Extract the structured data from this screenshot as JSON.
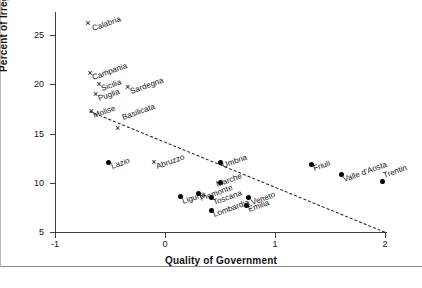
{
  "chart_data": {
    "type": "scatter",
    "title": "",
    "xlabel": "Quality of Government",
    "ylabel": "Percent of Irregular Work",
    "xlim": [
      -1,
      2
    ],
    "ylim": [
      5,
      26.8
    ],
    "xticks": [
      -1,
      0,
      1,
      2
    ],
    "xtick_labels": [
      "-1",
      "0",
      "1",
      "2"
    ],
    "yticks": [
      5,
      10,
      15,
      20,
      25
    ],
    "ytick_labels": [
      "5",
      "10",
      "15",
      "20",
      "25"
    ],
    "grid": false,
    "legend": "none",
    "marker_groups": {
      "cross": "Southern / Island regions marked with x",
      "dot": "Central and Northern regions marked with filled circle"
    },
    "points": [
      {
        "label": "Calabria",
        "x": -0.7,
        "y": 26.2,
        "marker": "cross",
        "label_dx": 6,
        "label_dy": 2
      },
      {
        "label": "Campania",
        "x": -0.68,
        "y": 21.1,
        "marker": "cross",
        "label_dx": 4,
        "label_dy": 1
      },
      {
        "label": "Sicilia",
        "x": -0.6,
        "y": 20.0,
        "marker": "cross",
        "label_dx": 4,
        "label_dy": 1
      },
      {
        "label": "Puglia",
        "x": -0.63,
        "y": 19.0,
        "marker": "cross",
        "label_dx": 4,
        "label_dy": 1
      },
      {
        "label": "Sardegna",
        "x": -0.34,
        "y": 19.7,
        "marker": "cross",
        "label_dx": 4,
        "label_dy": 1
      },
      {
        "label": "Molise",
        "x": -0.67,
        "y": 17.3,
        "marker": "cross",
        "label_dx": 4,
        "label_dy": 1
      },
      {
        "label": "Basilicata",
        "x": -0.43,
        "y": 15.6,
        "marker": "cross",
        "label_dx": 6,
        "label_dy": -14
      },
      {
        "label": "Lazio",
        "x": -0.51,
        "y": 12.1,
        "marker": "dot",
        "label_dx": 4,
        "label_dy": 1
      },
      {
        "label": "Abruzzo",
        "x": -0.1,
        "y": 12.1,
        "marker": "cross",
        "label_dx": 4,
        "label_dy": 1
      },
      {
        "label": "Umbria",
        "x": 0.5,
        "y": 12.1,
        "marker": "dot",
        "label_dx": 4,
        "label_dy": 0
      },
      {
        "label": "Marche",
        "x": 0.5,
        "y": 10.0,
        "marker": "dot",
        "label_dx": -2,
        "label_dy": -2
      },
      {
        "label": "Liguria",
        "x": 0.14,
        "y": 8.6,
        "marker": "dot",
        "label_dx": 4,
        "label_dy": 1
      },
      {
        "label": "Piemonte",
        "x": 0.3,
        "y": 8.9,
        "marker": "dot",
        "label_dx": 4,
        "label_dy": 1
      },
      {
        "label": "Toscana",
        "x": 0.42,
        "y": 8.5,
        "marker": "dot",
        "label_dx": 4,
        "label_dy": 1
      },
      {
        "label": "Lombardia",
        "x": 0.42,
        "y": 7.2,
        "marker": "dot",
        "label_dx": 4,
        "label_dy": 1
      },
      {
        "label": "Veneto",
        "x": 0.76,
        "y": 8.5,
        "marker": "dot",
        "label_dx": 4,
        "label_dy": 1
      },
      {
        "label": "Emilia",
        "x": 0.74,
        "y": 7.7,
        "marker": "dot",
        "label_dx": 4,
        "label_dy": 1
      },
      {
        "label": "Friuli",
        "x": 1.33,
        "y": 11.9,
        "marker": "dot",
        "label_dx": 4,
        "label_dy": 1
      },
      {
        "label": "Valle d'Aosta",
        "x": 1.6,
        "y": 10.8,
        "marker": "dot",
        "label_dx": 4,
        "label_dy": 1
      },
      {
        "label": "Trentin",
        "x": 1.98,
        "y": 10.1,
        "marker": "dot",
        "label_dx": 2,
        "label_dy": -10
      }
    ],
    "trendline": {
      "style": "dashed",
      "x_start": -0.68,
      "y_start": 17.3,
      "x_end": 2.0,
      "y_end": 5.05
    }
  }
}
